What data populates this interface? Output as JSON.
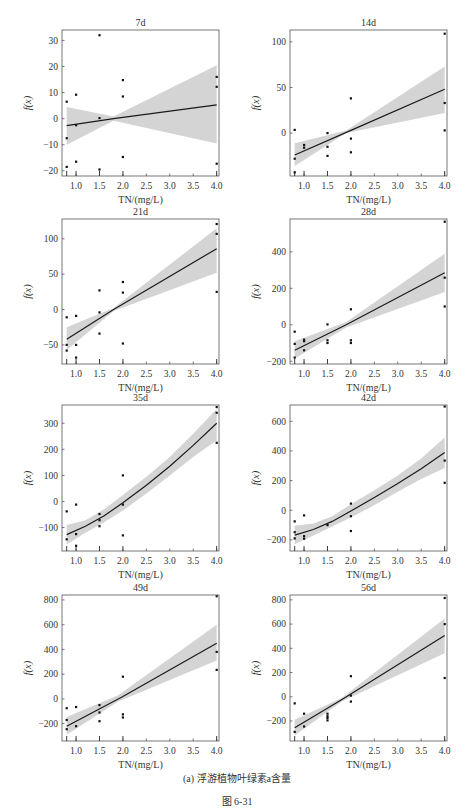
{
  "figure": {
    "subcaption": "(a) 浮游植物叶绿素a含量",
    "caption": "图 6-31",
    "style": {
      "band_color": "#d4d4d4",
      "line_color": "#1a1a1a",
      "point_color": "#111111",
      "frame_color": "#555555"
    }
  },
  "chart_data": [
    {
      "type": "scatter",
      "title": "7d",
      "xlabel": "TN/(mg/L)",
      "ylabel": "f(x)",
      "xlim": [
        0.7,
        4.05
      ],
      "ylim": [
        -22,
        34
      ],
      "xticks": [
        1.0,
        1.5,
        2.0,
        2.5,
        3.0,
        3.5,
        4.0
      ],
      "yticks": [
        -20,
        -10,
        0,
        10,
        20,
        30
      ],
      "rug_x": [
        0.8,
        1.0,
        1.5,
        2.0,
        4.0
      ],
      "points": [
        [
          0.8,
          6.5
        ],
        [
          0.8,
          -7.5
        ],
        [
          0.8,
          -18.5
        ],
        [
          1.0,
          9.2
        ],
        [
          1.0,
          -2.5
        ],
        [
          1.0,
          -16.5
        ],
        [
          1.5,
          32
        ],
        [
          1.5,
          0.2
        ],
        [
          1.5,
          -19.5
        ],
        [
          2.0,
          14.8
        ],
        [
          2.0,
          8.5
        ],
        [
          2.0,
          -14.7
        ],
        [
          4.0,
          16
        ],
        [
          4.0,
          12.2
        ],
        [
          4.0,
          -17.3
        ]
      ],
      "fit": {
        "x": [
          0.8,
          1.8,
          4.0
        ],
        "y": [
          -2.7,
          0.0,
          5.3
        ]
      },
      "band": {
        "x": [
          0.8,
          1.8,
          4.0
        ],
        "upper": [
          4.5,
          0.8,
          20.5
        ],
        "lower": [
          -10,
          -0.8,
          -9.5
        ]
      }
    },
    {
      "type": "scatter",
      "title": "14d",
      "xlabel": "TN/(mg/L)",
      "ylabel": "f(x)",
      "xlim": [
        0.7,
        4.05
      ],
      "ylim": [
        -47,
        113
      ],
      "xticks": [
        1.0,
        1.5,
        2.0,
        2.5,
        3.0,
        3.5,
        4.0
      ],
      "yticks": [
        0,
        50,
        100
      ],
      "rug_x": [
        0.8,
        1.0,
        1.5,
        2.0,
        4.0
      ],
      "points": [
        [
          0.8,
          3.5
        ],
        [
          0.8,
          -28
        ],
        [
          0.8,
          -43
        ],
        [
          1.0,
          -13
        ],
        [
          1.0,
          -16
        ],
        [
          1.5,
          0
        ],
        [
          1.5,
          -15
        ],
        [
          1.5,
          -25
        ],
        [
          2.0,
          38
        ],
        [
          2.0,
          -6
        ],
        [
          2.0,
          -21
        ],
        [
          4.0,
          109
        ],
        [
          4.0,
          33
        ],
        [
          4.0,
          3
        ]
      ],
      "fit": {
        "x": [
          0.8,
          2.0,
          4.0
        ],
        "y": [
          -24,
          3,
          48
        ]
      },
      "band": {
        "x": [
          0.8,
          1.9,
          4.0
        ],
        "upper": [
          -11,
          3,
          73
        ],
        "lower": [
          -36,
          0,
          22
        ]
      }
    },
    {
      "type": "scatter",
      "title": "21d",
      "xlabel": "TN/(mg/L)",
      "ylabel": "f(x)",
      "xlim": [
        0.7,
        4.05
      ],
      "ylim": [
        -77,
        128
      ],
      "xticks": [
        1.0,
        1.5,
        2.0,
        2.5,
        3.0,
        3.5,
        4.0
      ],
      "yticks": [
        -50,
        0,
        50,
        100
      ],
      "rug_x": [
        0.8,
        1.0,
        1.5,
        2.0,
        4.0
      ],
      "points": [
        [
          0.8,
          -11
        ],
        [
          0.8,
          -50
        ],
        [
          0.8,
          -58
        ],
        [
          1.0,
          -9
        ],
        [
          1.0,
          -50
        ],
        [
          1.0,
          -68
        ],
        [
          1.5,
          27
        ],
        [
          1.5,
          -4
        ],
        [
          1.5,
          -34
        ],
        [
          2.0,
          39
        ],
        [
          2.0,
          24
        ],
        [
          2.0,
          -48
        ],
        [
          4.0,
          121
        ],
        [
          4.0,
          107
        ],
        [
          4.0,
          25
        ]
      ],
      "fit": {
        "x": [
          0.8,
          1.8,
          4.0
        ],
        "y": [
          -42,
          0,
          86
        ]
      },
      "band": {
        "x": [
          0.8,
          1.8,
          4.0
        ],
        "upper": [
          -25,
          2,
          115
        ],
        "lower": [
          -57,
          -2,
          52
        ]
      }
    },
    {
      "type": "scatter",
      "title": "28d",
      "xlabel": "TN/(mg/L)",
      "ylabel": "f(x)",
      "xlim": [
        0.7,
        4.05
      ],
      "ylim": [
        -215,
        580
      ],
      "xticks": [
        1.0,
        1.5,
        2.0,
        2.5,
        3.0,
        3.5,
        4.0
      ],
      "yticks": [
        -200,
        0,
        200,
        400
      ],
      "rug_x": [
        0.8,
        1.0,
        1.5,
        2.0,
        4.0
      ],
      "points": [
        [
          0.8,
          -38
        ],
        [
          0.8,
          -105
        ],
        [
          0.8,
          -180
        ],
        [
          1.0,
          -82
        ],
        [
          1.0,
          -90
        ],
        [
          1.0,
          -140
        ],
        [
          1.5,
          2
        ],
        [
          1.5,
          -85
        ],
        [
          1.5,
          -100
        ],
        [
          2.0,
          85
        ],
        [
          2.0,
          -85
        ],
        [
          2.0,
          -100
        ],
        [
          4.0,
          565
        ],
        [
          4.0,
          258
        ],
        [
          4.0,
          100
        ]
      ],
      "fit": {
        "x": [
          0.8,
          1.9,
          4.0
        ],
        "y": [
          -140,
          0,
          285
        ]
      },
      "band": {
        "x": [
          0.8,
          1.9,
          4.0
        ],
        "upper": [
          -90,
          15,
          390
        ],
        "lower": [
          -185,
          -15,
          180
        ]
      }
    },
    {
      "type": "scatter",
      "title": "35d",
      "xlabel": "TN/(mg/L)",
      "ylabel": "f(x)",
      "xlim": [
        0.7,
        4.05
      ],
      "ylim": [
        -190,
        370
      ],
      "xticks": [
        1.0,
        1.5,
        2.0,
        2.5,
        3.0,
        3.5,
        4.0
      ],
      "yticks": [
        -100,
        0,
        100,
        200,
        300
      ],
      "rug_x": [
        0.8,
        1.0,
        1.5,
        2.0,
        4.0
      ],
      "points": [
        [
          0.8,
          -38
        ],
        [
          0.8,
          -145
        ],
        [
          1.0,
          -12
        ],
        [
          1.0,
          -125
        ],
        [
          1.0,
          -170
        ],
        [
          1.5,
          -48
        ],
        [
          1.5,
          -72
        ],
        [
          1.5,
          -95
        ],
        [
          2.0,
          100
        ],
        [
          2.0,
          -12
        ],
        [
          2.0,
          -130
        ],
        [
          4.0,
          362
        ],
        [
          4.0,
          340
        ],
        [
          4.0,
          225
        ]
      ],
      "fit": {
        "x": [
          0.8,
          1.2,
          1.6,
          2.0,
          2.5,
          3.0,
          3.5,
          4.0
        ],
        "y": [
          -127,
          -95,
          -55,
          -5,
          62,
          135,
          215,
          300
        ]
      },
      "band": {
        "x": [
          0.8,
          1.2,
          1.6,
          2.0,
          2.5,
          3.0,
          3.5,
          4.0
        ],
        "upper": [
          -90,
          -72,
          -30,
          25,
          95,
          170,
          260,
          355
        ],
        "lower": [
          -165,
          -120,
          -80,
          -35,
          30,
          100,
          170,
          235
        ]
      }
    },
    {
      "type": "scatter",
      "title": "42d",
      "xlabel": "TN/(mg/L)",
      "ylabel": "f(x)",
      "xlim": [
        0.7,
        4.05
      ],
      "ylim": [
        -275,
        710
      ],
      "xticks": [
        1.0,
        1.5,
        2.0,
        2.5,
        3.0,
        3.5,
        4.0
      ],
      "yticks": [
        -200,
        0,
        200,
        400,
        600
      ],
      "rug_x": [
        0.8,
        1.0,
        1.5,
        2.0,
        4.0
      ],
      "points": [
        [
          0.8,
          -75
        ],
        [
          0.8,
          -148
        ],
        [
          0.8,
          -190
        ],
        [
          1.0,
          -35
        ],
        [
          1.0,
          -175
        ],
        [
          1.0,
          -192
        ],
        [
          1.5,
          -100
        ],
        [
          2.0,
          45
        ],
        [
          2.0,
          -40
        ],
        [
          2.0,
          -140
        ],
        [
          4.0,
          700
        ],
        [
          4.0,
          335
        ],
        [
          4.0,
          185
        ]
      ],
      "fit": {
        "x": [
          0.8,
          1.2,
          1.6,
          2.0,
          2.5,
          3.0,
          3.5,
          4.0
        ],
        "y": [
          -168,
          -130,
          -75,
          -5,
          85,
          180,
          280,
          390
        ]
      },
      "band": {
        "x": [
          0.8,
          1.2,
          1.6,
          2.0,
          2.5,
          3.0,
          3.5,
          4.0
        ],
        "upper": [
          -105,
          -90,
          -40,
          40,
          135,
          235,
          350,
          490
        ],
        "lower": [
          -230,
          -170,
          -110,
          -50,
          35,
          125,
          210,
          285
        ]
      }
    },
    {
      "type": "scatter",
      "title": "49d",
      "xlabel": "TN/(mg/L)",
      "ylabel": "f(x)",
      "xlim": [
        0.7,
        4.05
      ],
      "ylim": [
        -340,
        840
      ],
      "xticks": [
        1.0,
        1.5,
        2.0,
        2.5,
        3.0,
        3.5,
        4.0
      ],
      "yticks": [
        -200,
        0,
        200,
        400,
        600,
        800
      ],
      "rug_x": [
        0.8,
        1.0,
        1.5,
        2.0,
        4.0
      ],
      "points": [
        [
          0.8,
          -75
        ],
        [
          0.8,
          -170
        ],
        [
          0.8,
          -245
        ],
        [
          1.0,
          -65
        ],
        [
          1.0,
          -220
        ],
        [
          1.5,
          -50
        ],
        [
          1.5,
          -110
        ],
        [
          1.5,
          -180
        ],
        [
          2.0,
          180
        ],
        [
          2.0,
          -125
        ],
        [
          2.0,
          -150
        ],
        [
          4.0,
          830
        ],
        [
          4.0,
          380
        ],
        [
          4.0,
          235
        ]
      ],
      "fit": {
        "x": [
          0.8,
          2.0,
          4.0
        ],
        "y": [
          -220,
          20,
          450
        ]
      },
      "band": {
        "x": [
          0.8,
          1.9,
          4.0
        ],
        "upper": [
          -145,
          30,
          600
        ],
        "lower": [
          -290,
          -20,
          310
        ]
      }
    },
    {
      "type": "scatter",
      "title": "56d",
      "xlabel": "TN/(mg/L)",
      "ylabel": "f(x)",
      "xlim": [
        0.7,
        4.05
      ],
      "ylim": [
        -365,
        840
      ],
      "xticks": [
        1.0,
        1.5,
        2.0,
        2.5,
        3.0,
        3.5,
        4.0
      ],
      "yticks": [
        -200,
        0,
        200,
        400,
        600,
        800
      ],
      "rug_x": [
        0.8,
        1.0,
        1.5,
        2.0,
        4.0
      ],
      "points": [
        [
          0.8,
          -55
        ],
        [
          0.8,
          -290
        ],
        [
          1.0,
          -140
        ],
        [
          1.0,
          -245
        ],
        [
          1.5,
          -140
        ],
        [
          1.5,
          -160
        ],
        [
          1.5,
          -175
        ],
        [
          1.5,
          -195
        ],
        [
          2.0,
          170
        ],
        [
          2.0,
          10
        ],
        [
          2.0,
          -40
        ],
        [
          4.0,
          815
        ],
        [
          4.0,
          600
        ],
        [
          4.0,
          155
        ]
      ],
      "fit": {
        "x": [
          0.8,
          1.8,
          4.0
        ],
        "y": [
          -255,
          -25,
          505
        ]
      },
      "band": {
        "x": [
          0.8,
          1.8,
          4.0
        ],
        "upper": [
          -190,
          -10,
          645
        ],
        "lower": [
          -320,
          -40,
          360
        ]
      }
    }
  ]
}
